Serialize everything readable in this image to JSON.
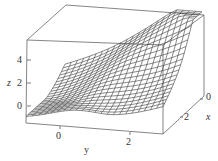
{
  "chart_data": {
    "type": "surface3d",
    "title": "",
    "xlabel": "x",
    "ylabel": "y",
    "zlabel": "z",
    "x_ticks": [
      "0",
      "2"
    ],
    "y_ticks": [
      "0",
      "2"
    ],
    "z_ticks": [
      "0",
      "2",
      "4"
    ],
    "xlim": [
      0,
      3
    ],
    "ylim": [
      -1,
      3
    ],
    "zlim": [
      -0.5,
      5
    ],
    "grid": false,
    "box": true,
    "mesh_style": "wireframe, dark gray lines on white"
  },
  "colors": {
    "mesh": "#3a3a3a",
    "box": "#555555",
    "background": "#ffffff"
  },
  "labels": {
    "z_axis": "z",
    "y_axis": "y",
    "x_axis": "x",
    "z_tick_0": "0",
    "z_tick_2": "2",
    "z_tick_4": "4",
    "y_tick_0": "0",
    "y_tick_2": "2",
    "x_tick_0": "0",
    "x_tick_2": "2"
  }
}
